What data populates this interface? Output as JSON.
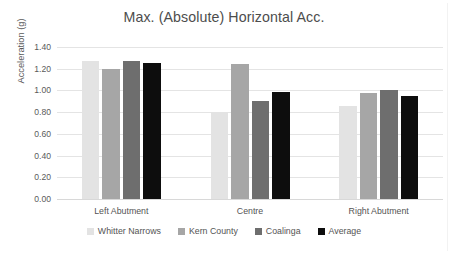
{
  "chart_data": {
    "type": "bar",
    "title": "Max. (Absolute) Horizontal Acc.",
    "xlabel": "",
    "ylabel": "Acceleration (g)",
    "categories": [
      "Left Abutment",
      "Centre",
      "Right Abutment"
    ],
    "series": [
      {
        "name": "Whitter Narrows",
        "color": "#e3e3e3",
        "values": [
          1.27,
          0.8,
          0.86
        ]
      },
      {
        "name": "Kern County",
        "color": "#a6a6a6",
        "values": [
          1.2,
          1.24,
          0.98
        ]
      },
      {
        "name": "Coalinga",
        "color": "#6e6e6e",
        "values": [
          1.27,
          0.9,
          1.0
        ]
      },
      {
        "name": "Average",
        "color": "#0d0d0d",
        "values": [
          1.25,
          0.99,
          0.95
        ]
      }
    ],
    "ylim": [
      0.0,
      1.4
    ],
    "yticks": [
      "0.00",
      "0.20",
      "0.40",
      "0.60",
      "0.80",
      "1.00",
      "1.20",
      "1.40"
    ],
    "ytick_values": [
      0.0,
      0.2,
      0.4,
      0.6,
      0.8,
      1.0,
      1.2,
      1.4
    ],
    "grid": true,
    "legend_position": "bottom"
  }
}
